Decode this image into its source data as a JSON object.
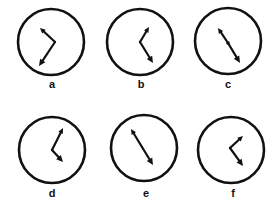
{
  "figure": {
    "background": "#ffffff",
    "ink_color": "#111111",
    "clocks": [
      {
        "label": "a",
        "center": [
          51,
          42
        ],
        "radius": 33,
        "hands": [
          {
            "tip": [
              40,
              28
            ],
            "from": [
              55,
              42
            ],
            "head": "arrow-small"
          },
          {
            "tip": [
              39,
              66
            ],
            "from": [
              55,
              42
            ],
            "head": "arrow-large"
          }
        ],
        "label_pos": [
          52,
          88
        ]
      },
      {
        "label": "b",
        "center": [
          140,
          42
        ],
        "radius": 33,
        "hands": [
          {
            "tip": [
              149,
              27
            ],
            "from": [
              140,
              42
            ],
            "head": "arrow-small"
          },
          {
            "tip": [
              153,
              63
            ],
            "from": [
              140,
              42
            ],
            "head": "arrow-large"
          }
        ],
        "label_pos": [
          141,
          88
        ]
      },
      {
        "label": "c",
        "center": [
          228,
          41
        ],
        "radius": 33,
        "hands": [
          {
            "tip": [
              218,
              28
            ],
            "from": [
              228,
              43
            ],
            "head": "arrow-small"
          },
          {
            "tip": [
              240,
              63
            ],
            "from": [
              228,
              43
            ],
            "head": "arrow-large"
          }
        ],
        "center_dot": true,
        "label_pos": [
          228,
          88
        ]
      },
      {
        "label": "d",
        "center": [
          52,
          150
        ],
        "radius": 33,
        "hands": [
          {
            "tip": [
              63,
              128
            ],
            "from": [
              52,
              150
            ],
            "head": "arrow-small"
          },
          {
            "tip": [
              63,
              162
            ],
            "from": [
              52,
              150
            ],
            "head": "arrow-large"
          }
        ],
        "label_pos": [
          52,
          197
        ]
      },
      {
        "label": "e",
        "center": [
          144,
          148
        ],
        "radius": 33,
        "hands": [
          {
            "tip": [
              131,
              129
            ],
            "from": [
              142,
              147
            ],
            "head": "arrow-small"
          },
          {
            "tip": [
              153,
              165
            ],
            "from": [
              142,
              147
            ],
            "head": "arrow-large"
          }
        ],
        "label_pos": [
          146,
          197
        ]
      },
      {
        "label": "f",
        "center": [
          231,
          150
        ],
        "radius": 33,
        "hands": [
          {
            "tip": [
              243,
              136
            ],
            "from": [
              230,
              148
            ],
            "head": "arrow-small"
          },
          {
            "tip": [
              243,
              166
            ],
            "from": [
              230,
              148
            ],
            "head": "arrow-large"
          }
        ],
        "label_pos": [
          233,
          197
        ]
      }
    ]
  }
}
